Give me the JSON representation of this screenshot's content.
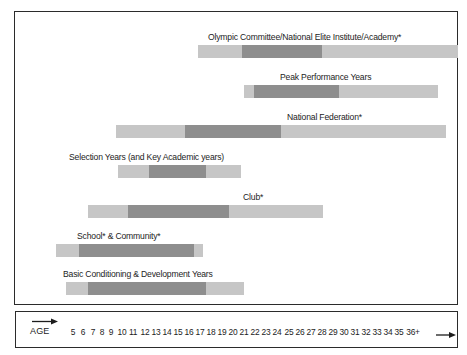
{
  "figure": {
    "axis": {
      "label": "AGE",
      "start_arrow_icon": "arrow-right-icon",
      "end_arrow_icon": "arrow-right-icon",
      "ticks": [
        "5",
        "6",
        "7",
        "8",
        "9",
        "10",
        "11",
        "12",
        "13",
        "14",
        "15",
        "16",
        "17",
        "18",
        "19",
        "20",
        "21",
        "22",
        "23",
        "24",
        "25",
        "26",
        "27",
        "28",
        "29",
        "30",
        "31",
        "32",
        "33",
        "34",
        "35",
        "36+"
      ]
    },
    "colors": {
      "light_segment": "#c6c6c6",
      "dark_segment": "#8e8e8e",
      "frame": "#2b2b2b",
      "text": "#1c1c1c",
      "background": "#ffffff"
    }
  },
  "chart_data": {
    "type": "bar",
    "title": "",
    "subtitle": "",
    "xlabel": "AGE",
    "ylabel": "",
    "xlim": [
      5,
      36
    ],
    "grid": false,
    "legend": "none",
    "orientation": "horizontal",
    "categories": [
      "Olympic Committee/National Elite Institute/Academy*",
      "Peak Performance Years",
      "National Federation*",
      "Selection Years (and Key Academic years)",
      "Club*",
      "School* & Community*",
      "Basic Conditioning & Development Years"
    ],
    "bars": [
      {
        "label": "Olympic Committee/National Elite Institute/Academy*",
        "range_start_age": 19,
        "range_end_age": 36,
        "core_start_age": 23,
        "core_end_age": 31,
        "label_align": "right"
      },
      {
        "label": "Peak Performance Years",
        "range_start_age": 24,
        "range_end_age": 35,
        "core_start_age": 25,
        "core_end_age": 33,
        "label_align": "right"
      },
      {
        "label": "National Federation*",
        "range_start_age": 13,
        "range_end_age": 35,
        "core_start_age": 20,
        "core_end_age": 29,
        "label_align": "right"
      },
      {
        "label": "Selection Years (and Key Academic years)",
        "range_start_age": 13,
        "range_end_age": 25,
        "core_start_age": 16,
        "core_end_age": 21,
        "label_align": "left"
      },
      {
        "label": "Club*",
        "range_start_age": 10,
        "range_end_age": 34,
        "core_start_age": 14,
        "core_end_age": 24,
        "label_align": "right"
      },
      {
        "label": "School* & Community*",
        "range_start_age": 7,
        "range_end_age": 22,
        "core_start_age": 9,
        "core_end_age": 21,
        "label_align": "left"
      },
      {
        "label": "Basic Conditioning & Development Years",
        "range_start_age": 8,
        "range_end_age": 26,
        "core_start_age": 10,
        "core_end_age": 22,
        "label_align": "left"
      }
    ]
  },
  "layout": {
    "rows": [
      {
        "label": "Olympic Committee/National Elite Institute/Academy*",
        "label_left_px": 193,
        "bar_left_px": 183,
        "bar_width_px": 260,
        "core_left_px": 44,
        "core_width_px": 80,
        "row_top_px": 20
      },
      {
        "label": "Peak Performance Years",
        "label_left_px": 265,
        "bar_left_px": 229,
        "bar_width_px": 194,
        "core_left_px": 10,
        "core_width_px": 85,
        "row_top_px": 60
      },
      {
        "label": "National Federation*",
        "label_left_px": 272,
        "bar_left_px": 101,
        "bar_width_px": 330,
        "core_left_px": 69,
        "core_width_px": 96,
        "row_top_px": 100
      },
      {
        "label": "Selection Years (and Key Academic years)",
        "label_left_px": 54,
        "bar_left_px": 103,
        "bar_width_px": 123,
        "core_left_px": 31,
        "core_width_px": 57,
        "row_top_px": 140
      },
      {
        "label": "Club*",
        "label_left_px": 228,
        "bar_left_px": 73,
        "bar_width_px": 235,
        "core_left_px": 40,
        "core_width_px": 101,
        "row_top_px": 180
      },
      {
        "label": "School* & Community*",
        "label_left_px": 62,
        "bar_left_px": 41,
        "bar_width_px": 147,
        "core_left_px": 23,
        "core_width_px": 115,
        "row_top_px": 219
      },
      {
        "label": "Basic Conditioning & Development Years",
        "label_left_px": 48,
        "bar_left_px": 51,
        "bar_width_px": 178,
        "core_left_px": 22,
        "core_width_px": 118,
        "row_top_px": 257
      }
    ],
    "tick_positions_px": [
      16,
      26,
      36,
      45,
      54,
      65,
      76,
      88,
      99,
      110,
      121,
      132,
      143,
      154,
      165,
      176,
      187,
      198,
      209,
      220,
      232,
      243,
      254,
      265,
      276,
      287,
      298,
      309,
      320,
      331,
      342,
      356
    ]
  }
}
